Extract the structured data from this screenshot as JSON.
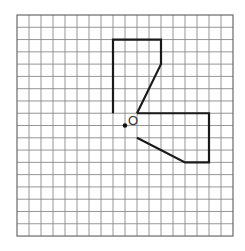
{
  "diagram": {
    "grid": {
      "origin_px": [
        17,
        15
      ],
      "cell_w": 12,
      "cell_h": 12.28,
      "cols": 18,
      "rows": 18,
      "line_color": "#8a8a8a"
    },
    "figures": [
      {
        "name": "upper-figure",
        "points": [
          [
            8,
            8
          ],
          [
            8,
            2
          ],
          [
            12,
            2
          ],
          [
            12,
            4
          ],
          [
            10,
            8
          ]
        ],
        "closed": false
      },
      {
        "name": "lower-figure",
        "points": [
          [
            10,
            8
          ],
          [
            16,
            8
          ],
          [
            16,
            12
          ],
          [
            14,
            12
          ],
          [
            10,
            10
          ]
        ],
        "closed": false
      }
    ],
    "center_point": {
      "grid": [
        9,
        9
      ],
      "label": "O"
    }
  }
}
